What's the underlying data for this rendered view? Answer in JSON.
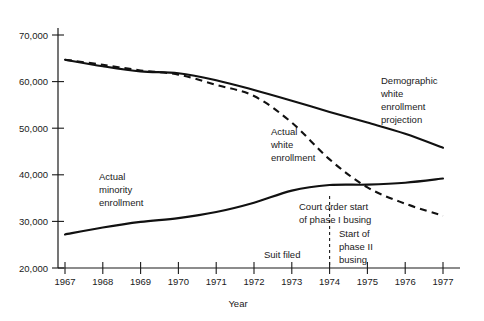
{
  "chart_data": {
    "type": "line",
    "title": "",
    "xlabel": "Year",
    "ylabel": "",
    "x": [
      1967,
      1968,
      1969,
      1970,
      1971,
      1972,
      1973,
      1974,
      1975,
      1976,
      1977
    ],
    "xlim": [
      1967,
      1977
    ],
    "ylim": [
      20000,
      70000
    ],
    "grid": false,
    "legend_position": "inline-annotations",
    "xtick_labels": [
      "1967",
      "1968",
      "1969",
      "1970",
      "1971",
      "1972",
      "1973",
      "1974",
      "1975",
      "1976",
      "1977"
    ],
    "ytick_labels": [
      "20,000",
      "30,000",
      "40,000",
      "50,000",
      "60,000",
      "70,000"
    ],
    "ytick_values": [
      20000,
      30000,
      40000,
      50000,
      60000,
      70000
    ],
    "series": [
      {
        "name": "Demographic white enrollment projection",
        "style": "solid",
        "values": [
          64700,
          63300,
          62200,
          61800,
          60300,
          58200,
          55900,
          53500,
          51200,
          48800,
          45800
        ]
      },
      {
        "name": "Actual white enrollment",
        "style": "dashed",
        "values": [
          64700,
          63600,
          62400,
          61500,
          59300,
          56900,
          51200,
          43300,
          37300,
          33800,
          31200
        ]
      },
      {
        "name": "Actual minority enrollment",
        "style": "solid",
        "values": [
          27200,
          28700,
          29900,
          30700,
          32000,
          34000,
          36600,
          37800,
          37900,
          38300,
          39200
        ]
      }
    ],
    "annotations": [
      {
        "name": "demographic-white-enrollment-projection",
        "lines": [
          "Demographic",
          "white",
          "enrollment",
          "projection"
        ]
      },
      {
        "name": "actual-white-enrollment",
        "lines": [
          "Actual",
          "white",
          "enrollment"
        ]
      },
      {
        "name": "actual-minority-enrollment",
        "lines": [
          "Actual",
          "minority",
          "enrollment"
        ]
      },
      {
        "name": "court-order-start-of-phase-i-busing",
        "lines": [
          "Court order start",
          "of phase I busing"
        ]
      },
      {
        "name": "start-of-phase-ii-busing",
        "lines": [
          "Start of",
          "phase II",
          "busing"
        ]
      },
      {
        "name": "suit-filed",
        "lines": [
          "Suit filed"
        ]
      }
    ],
    "event_markers": [
      {
        "name": "court-order-1974",
        "x": 1974,
        "style": "vertical-dashed"
      }
    ],
    "colors": {
      "ink": "#111111",
      "background": "#ffffff"
    }
  },
  "axis": {
    "y_labels": {
      "t70000": "70,000",
      "t60000": "60,000",
      "t50000": "50,000",
      "t40000": "40,000",
      "t30000": "30,000",
      "t20000": "20,000"
    },
    "x_labels": {
      "y1967": "1967",
      "y1968": "1968",
      "y1969": "1969",
      "y1970": "1970",
      "y1971": "1971",
      "y1972": "1972",
      "y1973": "1973",
      "y1974": "1974",
      "y1975": "1975",
      "y1976": "1976",
      "y1977": "1977"
    },
    "x_title": "Year"
  },
  "labels": {
    "demographic": {
      "l1": "Demographic",
      "l2": "white",
      "l3": "enrollment",
      "l4": "projection"
    },
    "actual_white": {
      "l1": "Actual",
      "l2": "white",
      "l3": "enrollment"
    },
    "actual_minority": {
      "l1": "Actual",
      "l2": "minority",
      "l3": "enrollment"
    },
    "court_order": {
      "l1": "Court order start",
      "l2": "of phase I busing"
    },
    "phase_two": {
      "l1": "Start of",
      "l2": "phase II",
      "l3": "busing"
    },
    "suit_filed": {
      "l1": "Suit filed"
    }
  }
}
